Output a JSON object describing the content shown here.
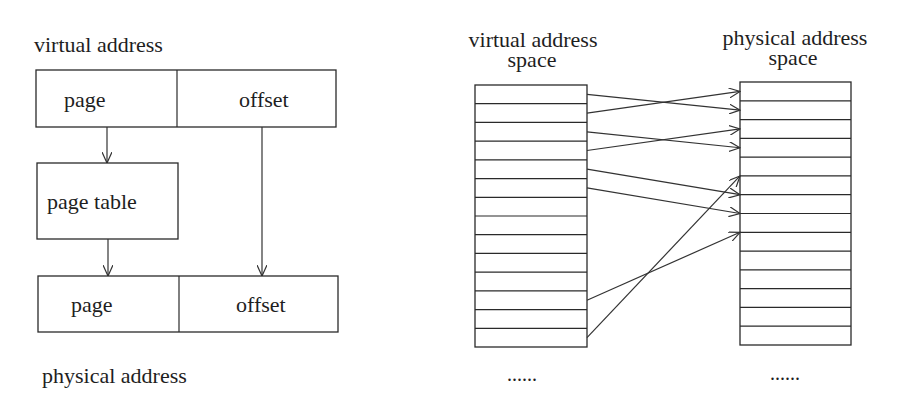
{
  "colors": {
    "stroke": "#2a2a2a",
    "text": "#1e1e1e",
    "background": "#ffffff"
  },
  "left_diagram": {
    "virtual_label": "virtual address",
    "virtual_fields": {
      "page": "page",
      "offset": "offset"
    },
    "page_table_label": "page table",
    "physical_fields": {
      "page": "page",
      "offset": "offset"
    },
    "physical_label": "physical address"
  },
  "right_diagram": {
    "virtual_space": {
      "title_line1": "virtual address",
      "title_line2": "space",
      "rows": 14,
      "ellipsis": "......"
    },
    "physical_space": {
      "title_line1": "physical address",
      "title_line2": "space",
      "rows": 14,
      "ellipsis": "......"
    },
    "mappings": [
      {
        "from_row": 0,
        "to_row": 1
      },
      {
        "from_row": 1,
        "to_row": 0
      },
      {
        "from_row": 2,
        "to_row": 3
      },
      {
        "from_row": 3,
        "to_row": 2
      },
      {
        "from_row": 4,
        "to_row": 5.5
      },
      {
        "from_row": 5,
        "to_row": 6.5
      },
      {
        "from_row": 11,
        "to_row": 7.5
      },
      {
        "from_row": 13,
        "to_row": 4.5
      }
    ]
  }
}
